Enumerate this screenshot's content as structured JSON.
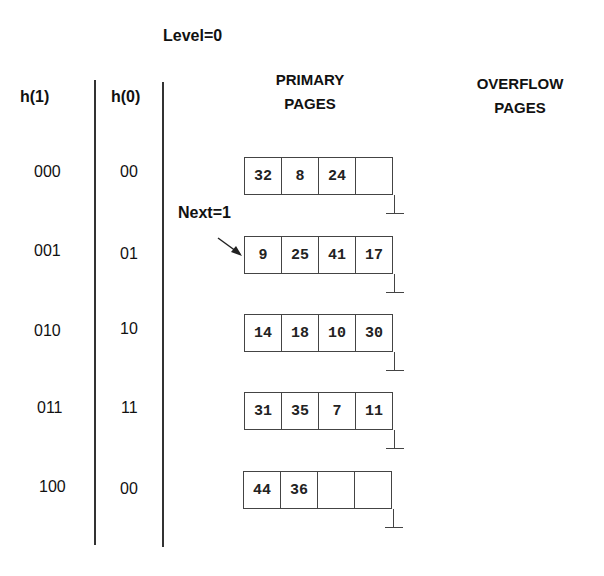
{
  "level_label": "Level=0",
  "next_label": "Next=1",
  "headers": {
    "h1": "h(1)",
    "h0": "h(0)",
    "primary_line1": "PRIMARY",
    "primary_line2": "PAGES",
    "overflow_line1": "OVERFLOW",
    "overflow_line2": "PAGES"
  },
  "rows": [
    {
      "h1": "000",
      "h0": "00",
      "cells": [
        "32",
        "8",
        "24",
        ""
      ]
    },
    {
      "h1": "001",
      "h0": "01",
      "cells": [
        "9",
        "25",
        "41",
        "17"
      ]
    },
    {
      "h1": "010",
      "h0": "10",
      "cells": [
        "14",
        "18",
        "10",
        "30"
      ]
    },
    {
      "h1": "011",
      "h0": "11",
      "cells": [
        "31",
        "35",
        "7",
        "11"
      ]
    },
    {
      "h1": "100",
      "h0": "00",
      "cells": [
        "44",
        "36",
        "",
        ""
      ]
    }
  ],
  "next_points_to_row": 1
}
